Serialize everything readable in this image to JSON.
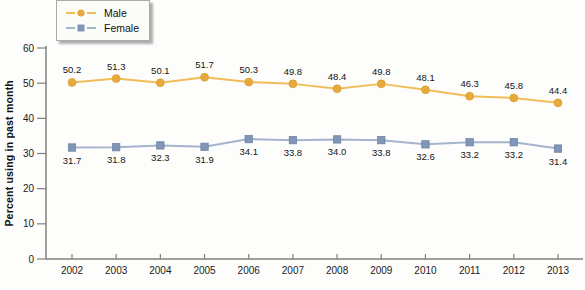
{
  "chart_data": {
    "type": "line",
    "x": [
      2002,
      2003,
      2004,
      2005,
      2006,
      2007,
      2008,
      2009,
      2010,
      2011,
      2012,
      2013
    ],
    "series": [
      {
        "name": "Male",
        "marker": "circle",
        "marker_color": "#e7a83c",
        "line_color": "#f1bd59",
        "label_position": "above",
        "values": [
          50.2,
          51.3,
          50.1,
          51.7,
          50.3,
          49.8,
          48.4,
          49.8,
          48.1,
          46.3,
          45.8,
          44.4
        ]
      },
      {
        "name": "Female",
        "marker": "square",
        "marker_color": "#8196b6",
        "line_color": "#a3b4cc",
        "label_position": "below",
        "values": [
          31.7,
          31.8,
          32.3,
          31.9,
          34.1,
          33.8,
          34.0,
          33.8,
          32.6,
          33.2,
          33.2,
          31.4
        ]
      }
    ],
    "title": "",
    "xlabel": "",
    "ylabel": "Percent using in past month",
    "ylim": [
      0,
      60
    ],
    "yticks": [
      0,
      10,
      20,
      30,
      40,
      50,
      60
    ],
    "grid": false,
    "value_labels": true,
    "legend_position": "top-left",
    "axis_color": "#7f7f7f",
    "tick_text_color": "#1a1a1a",
    "value_label_color": "#141414"
  }
}
